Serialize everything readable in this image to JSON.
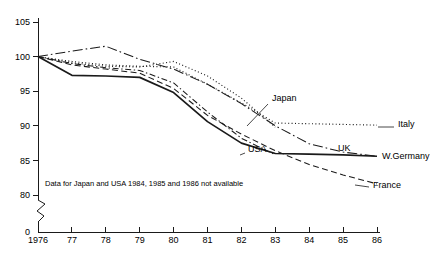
{
  "chart_data": {
    "type": "line",
    "title": "",
    "xlabel": "",
    "ylabel": "",
    "x": [
      1976,
      1977,
      1978,
      1979,
      1980,
      1981,
      1982,
      1983,
      1984,
      1985,
      1986
    ],
    "xtick_labels": [
      "1976",
      "77",
      "78",
      "79",
      "80",
      "81",
      "82",
      "83",
      "84",
      "85",
      "86"
    ],
    "ytick_labels": [
      "105",
      "100",
      "95",
      "90",
      "85",
      "80",
      "0"
    ],
    "ytick_values": [
      105,
      100,
      95,
      90,
      85,
      80
    ],
    "ylim": [
      80,
      105
    ],
    "axis_break": true,
    "zero_label": "0",
    "grid": false,
    "legend_position": "inline-right",
    "series": [
      {
        "name": "Japan",
        "style": "dotted",
        "label": "Japan",
        "values": [
          100,
          99.1,
          98.6,
          98.5,
          99.3,
          97.2,
          94.0,
          89.8,
          null,
          null,
          null
        ]
      },
      {
        "name": "Italy",
        "style": "dotted",
        "label": "Italy",
        "values": [
          100,
          99.3,
          98.8,
          98.6,
          98.5,
          96.0,
          93.3,
          90.4,
          90.3,
          90.2,
          90.1
        ]
      },
      {
        "name": "USA",
        "style": "dash-dot",
        "label": "USA",
        "values": [
          100,
          99.0,
          98.4,
          98.0,
          96.2,
          92.0,
          88.2,
          85.8,
          null,
          null,
          null
        ]
      },
      {
        "name": "UK",
        "style": "solid",
        "label": "UK",
        "values": [
          100,
          97.3,
          97.2,
          97.0,
          94.8,
          90.6,
          87.5,
          86.0,
          85.9,
          85.8,
          85.6
        ]
      },
      {
        "name": "W.Germany",
        "style": "dash-dot-long",
        "label": "W.Germany",
        "values": [
          100,
          100.8,
          101.5,
          99.6,
          98.2,
          96.0,
          93.2,
          90.0,
          87.4,
          86.2,
          85.6
        ]
      },
      {
        "name": "France",
        "style": "dashed",
        "label": "France",
        "values": [
          100,
          98.8,
          98.2,
          97.6,
          95.4,
          91.5,
          88.8,
          86.4,
          84.4,
          82.9,
          81.6
        ]
      }
    ],
    "annotations": [
      {
        "name": "missing-data-note",
        "text": "Data for Japan and USA 1984, 1985 and 1986 not available"
      }
    ]
  },
  "geometry": {
    "plot_left": 38,
    "plot_right": 377,
    "y_top_value": 105,
    "y_top_px": 22,
    "y_bottom_value": 80,
    "y_bottom_px": 195,
    "axis_bottom_px": 232,
    "break_top_px": 200,
    "break_bottom_px": 222
  },
  "label_positions": {
    "Japan": {
      "x": 272,
      "y": 101,
      "leader": [
        247,
        126,
        268,
        104
      ]
    },
    "Italy": {
      "x": 398,
      "y": 127,
      "leader": [
        378,
        127,
        394,
        127
      ]
    },
    "USA": {
      "x": 248,
      "y": 152,
      "leader": [
        240,
        155,
        245,
        153
      ]
    },
    "UK": {
      "x": 338,
      "y": 151,
      "leader": null
    },
    "W.Germany": {
      "x": 382,
      "y": 159,
      "leader": null
    },
    "France": {
      "x": 373,
      "y": 188,
      "leader": [
        355,
        185,
        369,
        187
      ]
    },
    "note": {
      "x": 45,
      "y": 186
    }
  }
}
